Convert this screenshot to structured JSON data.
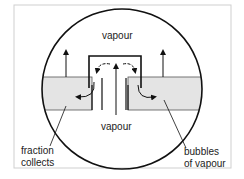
{
  "diagram": {
    "type": "bubble-cap tray cross-section (fractional distillation)",
    "labels": {
      "vapour_top": "vapour",
      "vapour_bottom": "vapour",
      "fraction_line1": "fraction",
      "fraction_line2": "collects",
      "bubbles_line1": "bubbles",
      "bubbles_line2": "of vapour"
    },
    "colors": {
      "stroke": "#111111",
      "liquid": "#e4e4e4",
      "frame": "#cfcfcf",
      "background": "#ffffff"
    }
  }
}
